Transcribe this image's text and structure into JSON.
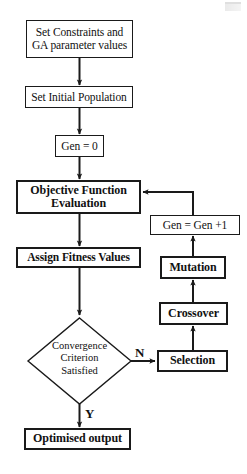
{
  "diagram": {
    "type": "flowchart",
    "canvas": {
      "width": 247,
      "height": 474,
      "background": "#ffffff"
    },
    "stroke_color": "#1a1a1a",
    "text_color": "#111111"
  },
  "nodes": {
    "set_constraints": {
      "label": "Set Constraints and\nGA parameter values",
      "shape": "rectangle",
      "bold": false
    },
    "set_initial_population": {
      "label": "Set Initial Population",
      "shape": "rectangle",
      "bold": false
    },
    "gen_zero": {
      "label": "Gen = 0",
      "shape": "rectangle",
      "bold": false
    },
    "objective_function": {
      "label": "Objective Function\nEvaluation",
      "shape": "rectangle",
      "bold": true
    },
    "assign_fitness": {
      "label": "Assign Fitness Values",
      "shape": "rectangle",
      "bold": true
    },
    "convergence": {
      "label": "Convergence\nCriterion\nSatisfied",
      "shape": "diamond",
      "bold": false
    },
    "optimised_output": {
      "label": "Optimised output",
      "shape": "rectangle",
      "bold": true
    },
    "selection": {
      "label": "Selection",
      "shape": "rectangle",
      "bold": true
    },
    "crossover": {
      "label": "Crossover",
      "shape": "rectangle",
      "bold": true
    },
    "mutation": {
      "label": "Mutation",
      "shape": "rectangle",
      "bold": true
    },
    "gen_increment": {
      "label": "Gen = Gen +1",
      "shape": "rectangle",
      "bold": false
    }
  },
  "edge_labels": {
    "no_branch": "N",
    "yes_branch": "Y"
  },
  "flow_order": [
    "set_constraints",
    "set_initial_population",
    "gen_zero",
    "objective_function",
    "assign_fitness",
    "convergence",
    "optimised_output",
    "selection",
    "crossover",
    "mutation",
    "gen_increment"
  ]
}
